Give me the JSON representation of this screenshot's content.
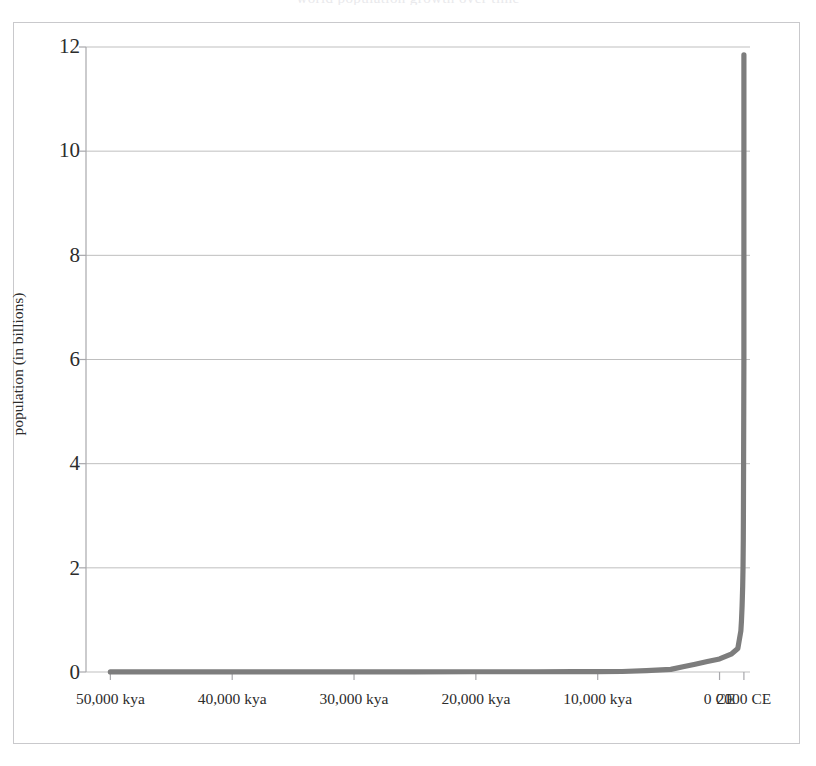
{
  "chart_data": {
    "type": "line",
    "title": "world population growth over time",
    "xlabel": "",
    "ylabel": "population (in billions)",
    "ylim": [
      0,
      12
    ],
    "yticks": [
      0,
      2,
      4,
      6,
      8,
      10,
      12
    ],
    "ytick_labels": [
      "0",
      "2",
      "4",
      "6",
      "8",
      "10",
      "12"
    ],
    "xtick_labels": [
      "50,000 kya",
      "40,000 kya",
      "30,000 kya",
      "20,000 kya",
      "10,000 kya",
      "0 CE",
      "2000 CE"
    ],
    "x_values_kya": [
      50000,
      40000,
      30000,
      20000,
      10000,
      0,
      -2000
    ],
    "grid": true,
    "grid_axis": "y",
    "legend": "none",
    "line_color": "#7d7d7d",
    "grid_color": "#bfbfbf",
    "frame_color": "#c9c9cc",
    "series": [
      {
        "name": "world population",
        "x_kya": [
          50000,
          45000,
          40000,
          35000,
          30000,
          25000,
          20000,
          15000,
          12000,
          10000,
          8000,
          6000,
          4000,
          3000,
          2000,
          1000,
          0,
          -500,
          -1000,
          -1500,
          -1750,
          -1800,
          -1850,
          -1900,
          -1927,
          -1950,
          -1960,
          -1974,
          -1987,
          -1999,
          -2000
        ],
        "values": [
          0.002,
          0.002,
          0.003,
          0.003,
          0.004,
          0.004,
          0.005,
          0.005,
          0.006,
          0.007,
          0.01,
          0.025,
          0.05,
          0.1,
          0.15,
          0.2,
          0.25,
          0.3,
          0.35,
          0.45,
          0.79,
          0.98,
          1.26,
          1.65,
          2.0,
          2.55,
          3.03,
          4.0,
          5.0,
          6.0,
          11.85
        ]
      }
    ],
    "peak_value": 11.85,
    "peak_label": "2000 CE"
  },
  "axis": {
    "y_title": "population (in billions)"
  }
}
